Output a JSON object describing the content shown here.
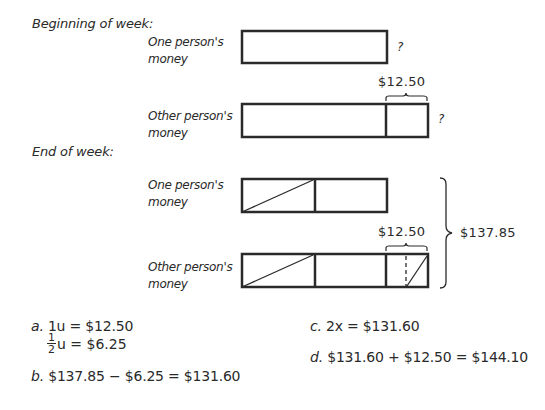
{
  "sections": {
    "beginning": {
      "title": "Beginning of week:"
    },
    "end": {
      "title": "End of week:"
    }
  },
  "labels": {
    "one_person": "One person's money",
    "one_person_line1": "One person's",
    "other_person_line1": "Other person's",
    "money": "money"
  },
  "beginning": {
    "one_unknown": "?",
    "other_unknown": "?",
    "difference": "$12.50"
  },
  "end": {
    "difference": "$12.50",
    "total": "$137.85"
  },
  "solutions": {
    "a": {
      "prefix": "a.",
      "line1": "1u = $12.50",
      "frac_num": "1",
      "frac_den": "2",
      "line2_rest": "u = $6.25"
    },
    "b": {
      "prefix": "b.",
      "text": "$137.85 − $6.25 = $131.60"
    },
    "c": {
      "prefix": "c.",
      "text": "2x = $131.60"
    },
    "d": {
      "prefix": "d.",
      "text": "$131.60 + $12.50 = $144.10"
    }
  },
  "colors": {
    "ink": "#2a2a2a",
    "background": "#ffffff"
  }
}
